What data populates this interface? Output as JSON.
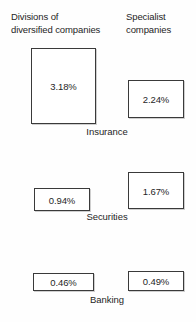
{
  "chart_data": {
    "type": "bar",
    "title": "",
    "subtitle": "",
    "xlabel": "",
    "ylabel": "",
    "grid": false,
    "legend_position": "top",
    "units": "percent",
    "note": "Area-proportional rectangles; each rectangle is labeled with its value in percent.",
    "categories": [
      "Insurance",
      "Securities",
      "Banking"
    ],
    "series": [
      {
        "name": "Divisions of diversified companies",
        "values": [
          3.18,
          0.94,
          0.46
        ],
        "labels": [
          "3.18%",
          "0.94%",
          "0.46%"
        ]
      },
      {
        "name": "Specialist companies",
        "values": [
          2.24,
          1.67,
          0.49
        ],
        "labels": [
          "2.24%",
          "1.67%",
          "0.49%"
        ]
      }
    ]
  },
  "headers": {
    "left": "Divisions of\ndiversified companies",
    "right": "Specialist\ncompanies"
  },
  "rows": [
    {
      "category": "Insurance",
      "left_value": "3.18%",
      "right_value": "2.24%"
    },
    {
      "category": "Securities",
      "left_value": "0.94%",
      "right_value": "1.67%"
    },
    {
      "category": "Banking",
      "left_value": "0.46%",
      "right_value": "0.49%"
    }
  ],
  "colors": {
    "box_border": "#3a3a3a",
    "box_fill": "#ffffff",
    "text": "#252525",
    "background": "#fefefe"
  }
}
